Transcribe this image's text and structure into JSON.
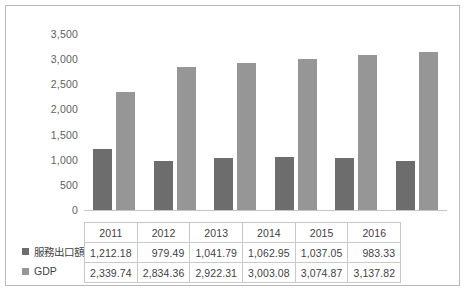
{
  "chart_data": {
    "type": "bar",
    "title": "",
    "xlabel": "",
    "ylabel": "",
    "categories": [
      "2011",
      "2012",
      "2013",
      "2014",
      "2015",
      "2016"
    ],
    "series": [
      {
        "name": "服務出口額",
        "color": "#6d6d6d",
        "values": [
          1212.18,
          979.49,
          1041.79,
          1062.95,
          1037.05,
          983.33
        ],
        "labels": [
          "1,212.18",
          "979.49",
          "1,041.79",
          "1,062.95",
          "1,037.05",
          "983.33"
        ]
      },
      {
        "name": "GDP",
        "color": "#969696",
        "values": [
          2339.74,
          2834.36,
          2922.31,
          3003.08,
          3074.87,
          3137.82
        ],
        "labels": [
          "2,339.74",
          "2,834.36",
          "2,922.31",
          "3,003.08",
          "3,074.87",
          "3,137.82"
        ]
      }
    ],
    "ylim": [
      0,
      3500
    ],
    "yticks": [
      3500,
      3000,
      2500,
      2000,
      1500,
      1000,
      500,
      0
    ],
    "ytick_labels": [
      "3,500",
      "3,000",
      "2,500",
      "2,000",
      "1,500",
      "1,000",
      "500",
      "0"
    ],
    "grid": false,
    "legend_position": "data-table-left",
    "data_table_visible": true
  },
  "colors": {
    "series_a": "#6d6d6d",
    "series_b": "#969696",
    "border": "#b8b8b8",
    "table_border": "#c9c9c9",
    "text": "#3f3f3f",
    "axis_text": "#5e5e5e",
    "background": "#ffffff"
  }
}
